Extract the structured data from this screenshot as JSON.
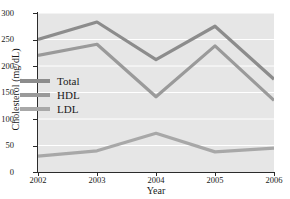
{
  "chart_data": {
    "type": "line",
    "title": "",
    "xlabel": "Year",
    "ylabel": "Cholesterol (mg/dL)",
    "categories": [
      "2002",
      "2003",
      "2004",
      "2005",
      "2006"
    ],
    "x": [
      2002,
      2003,
      2004,
      2005,
      2006
    ],
    "xlim": [
      2002,
      2006
    ],
    "ylim": [
      0,
      300
    ],
    "yticks": [
      0,
      50,
      100,
      150,
      200,
      250,
      300
    ],
    "ytick_labels": [
      "0",
      "50",
      "100",
      "150",
      "200",
      "250",
      "300"
    ],
    "xticks": [
      2002,
      2003,
      2004,
      2005,
      2006
    ],
    "xtick_labels": [
      "2002",
      "2003",
      "2004",
      "2005",
      "2006"
    ],
    "grid": "horizontal-white-on-gray",
    "legend_position": "inside-left-middle",
    "plot_background": "#e6e6e6",
    "gridline_color": "#ffffff",
    "axis_color": "#2b2b2b",
    "series": [
      {
        "name": "Total",
        "color": "#8c8c8c",
        "values": [
          250,
          283,
          212,
          275,
          175
        ]
      },
      {
        "name": "HDL",
        "color": "#9a9a9a",
        "values": [
          220,
          241,
          142,
          238,
          135
        ]
      },
      {
        "name": "LDL",
        "color": "#a8a8a8",
        "values": [
          30,
          40,
          73,
          38,
          45
        ]
      }
    ]
  }
}
